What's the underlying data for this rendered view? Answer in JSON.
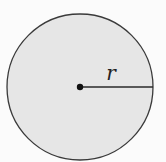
{
  "diagram": {
    "type": "circle-with-radius",
    "label_radius": "r",
    "colors": {
      "fill": "#e6e6e6",
      "stroke": "#3a3a3a",
      "background": "#fbfbfb"
    }
  }
}
